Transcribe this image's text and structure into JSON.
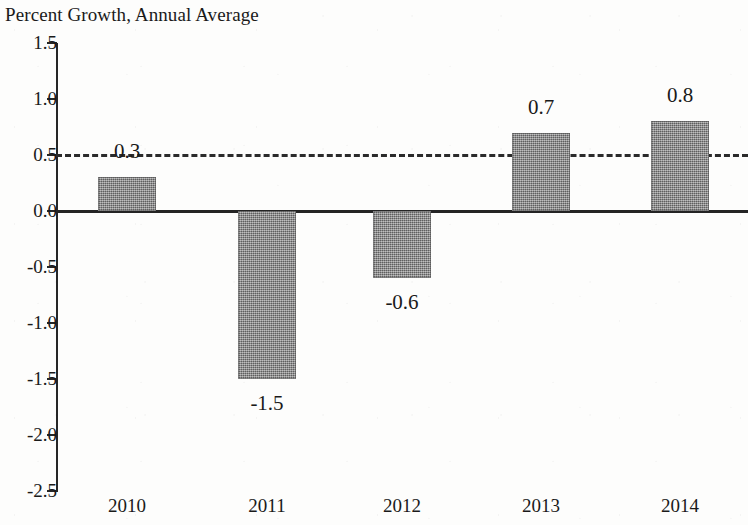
{
  "chart_data": {
    "type": "bar",
    "title": "Percent Growth, Annual Average",
    "xlabel": "",
    "ylabel": "Percent Growth, Annual Average",
    "categories": [
      "2010",
      "2011",
      "2012",
      "2013",
      "2014"
    ],
    "values": [
      0.3,
      -1.5,
      -0.6,
      0.7,
      0.8
    ],
    "value_labels": [
      "0.3",
      "-1.5",
      "-0.6",
      "0.7",
      "0.8"
    ],
    "ylim": [
      -2.5,
      1.5
    ],
    "ytick_values": [
      1.5,
      1.0,
      0.5,
      0.0,
      -0.5,
      -1.0,
      -1.5,
      -2.0,
      -2.5
    ],
    "ytick_labels": [
      "1.5",
      "1.0",
      "0.5",
      "0.0",
      "-0.5",
      "-1.0",
      "-1.5",
      "-2.0",
      "-2.5"
    ],
    "grid": false,
    "legend": null,
    "reference_line": {
      "value": 0.5,
      "style": "dashed"
    },
    "zero_line": {
      "value": 0.0,
      "style": "solid"
    },
    "bar_color": "#7f7f7f",
    "axis_color": "#262626",
    "background_color": "#fdfdfc"
  },
  "series": [
    {
      "category": "2010",
      "value": 0.3,
      "label": "0.3"
    },
    {
      "category": "2011",
      "value": -1.5,
      "label": "-1.5"
    },
    {
      "category": "2012",
      "value": -0.6,
      "label": "-0.6"
    },
    {
      "category": "2013",
      "value": 0.7,
      "label": "0.7"
    },
    {
      "category": "2014",
      "value": 0.8,
      "label": "0.8"
    }
  ]
}
